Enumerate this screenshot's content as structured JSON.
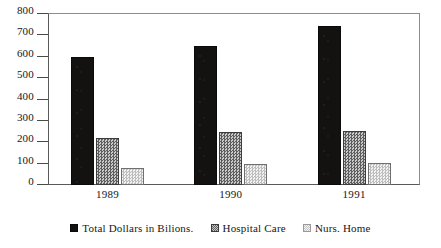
{
  "chart_data": {
    "type": "bar",
    "title": "",
    "subtitle": "",
    "xlabel": "",
    "ylabel": "",
    "categories": [
      "1989",
      "1990",
      "1991"
    ],
    "series": [
      {
        "name": "Total Dollars in Bilions.",
        "swatch": "solid-black-square",
        "color": "#141210",
        "values": [
          600,
          650,
          742
        ]
      },
      {
        "name": "Hospital Care",
        "swatch": "checkerboard-gray-square",
        "color": "#7e7e7e",
        "values": [
          222,
          250,
          252
        ]
      },
      {
        "name": "Nurs. Home",
        "swatch": "light-dotted-square",
        "color": "#dedede",
        "values": [
          78,
          98,
          105
        ]
      }
    ],
    "ylim": [
      0,
      800
    ],
    "ytick_step": 100,
    "yticks": [
      "800",
      "700",
      "600",
      "500",
      "400",
      "300",
      "200",
      "100",
      "0"
    ],
    "grid": false,
    "legend_position": "bottom-center",
    "axis_frame": true
  },
  "legend": {
    "items": [
      {
        "label": "Total Dollars in Bilions."
      },
      {
        "label": "Hospital Care"
      },
      {
        "label": "Nurs. Home"
      }
    ]
  }
}
